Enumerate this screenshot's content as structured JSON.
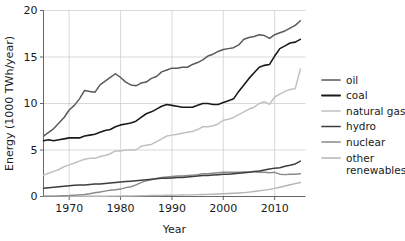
{
  "chart_data": {
    "type": "line",
    "title": "",
    "xlabel": "Year",
    "ylabel": "Energy (1000 TWh/year)",
    "xlim": [
      1965,
      2016
    ],
    "ylim": [
      0,
      20
    ],
    "xticks": [
      1970,
      1980,
      1990,
      2000,
      2010
    ],
    "yticks": [
      0,
      5,
      10,
      15,
      20
    ],
    "xticklabels": [
      "1970",
      "1980",
      "1990",
      "2000",
      "2010"
    ],
    "yticklabels": [
      "0",
      "5",
      "10",
      "15",
      "20"
    ],
    "grid": true,
    "legend_position": "right",
    "x": [
      1965,
      1966,
      1967,
      1968,
      1969,
      1970,
      1971,
      1972,
      1973,
      1974,
      1975,
      1976,
      1977,
      1978,
      1979,
      1980,
      1981,
      1982,
      1983,
      1984,
      1985,
      1986,
      1987,
      1988,
      1989,
      1990,
      1991,
      1992,
      1993,
      1994,
      1995,
      1996,
      1997,
      1998,
      1999,
      2000,
      2001,
      2002,
      2003,
      2004,
      2005,
      2006,
      2007,
      2008,
      2009,
      2010,
      2011,
      2012,
      2013,
      2014,
      2015
    ],
    "series": [
      {
        "name": "oil",
        "color": "#5a5a5a",
        "width": 1.5,
        "values": [
          6.5,
          6.9,
          7.3,
          7.9,
          8.5,
          9.3,
          9.8,
          10.5,
          11.4,
          11.3,
          11.2,
          12.0,
          12.4,
          12.8,
          13.2,
          12.8,
          12.3,
          12.0,
          11.9,
          12.2,
          12.3,
          12.7,
          12.9,
          13.4,
          13.6,
          13.8,
          13.8,
          13.9,
          13.9,
          14.2,
          14.4,
          14.7,
          15.1,
          15.3,
          15.6,
          15.8,
          15.9,
          16.0,
          16.3,
          16.9,
          17.1,
          17.2,
          17.4,
          17.3,
          17.0,
          17.4,
          17.6,
          17.8,
          18.1,
          18.4,
          18.9
        ]
      },
      {
        "name": "coal",
        "color": "#1a1a1a",
        "width": 1.6,
        "values": [
          6.0,
          6.1,
          6.0,
          6.1,
          6.2,
          6.3,
          6.3,
          6.3,
          6.5,
          6.6,
          6.7,
          6.9,
          7.1,
          7.2,
          7.5,
          7.7,
          7.8,
          7.9,
          8.1,
          8.5,
          8.9,
          9.1,
          9.4,
          9.7,
          9.9,
          9.8,
          9.7,
          9.6,
          9.6,
          9.6,
          9.8,
          10.0,
          10.0,
          9.9,
          9.9,
          10.1,
          10.3,
          10.5,
          11.3,
          12.0,
          12.7,
          13.3,
          13.9,
          14.1,
          14.2,
          15.1,
          15.9,
          16.2,
          16.5,
          16.6,
          16.9
        ]
      },
      {
        "name": "natural gas",
        "color": "#c0c0c0",
        "width": 1.5,
        "values": [
          2.3,
          2.5,
          2.7,
          2.9,
          3.2,
          3.4,
          3.6,
          3.8,
          4.0,
          4.1,
          4.1,
          4.3,
          4.4,
          4.6,
          4.9,
          4.9,
          5.0,
          5.0,
          5.0,
          5.4,
          5.5,
          5.6,
          5.9,
          6.2,
          6.5,
          6.6,
          6.7,
          6.8,
          6.9,
          7.0,
          7.2,
          7.5,
          7.5,
          7.6,
          7.8,
          8.2,
          8.3,
          8.5,
          8.8,
          9.1,
          9.4,
          9.6,
          10.0,
          10.2,
          9.9,
          10.7,
          11.0,
          11.3,
          11.5,
          11.6,
          13.7
        ]
      },
      {
        "name": "hydro",
        "color": "#3d3d3d",
        "width": 1.5,
        "values": [
          0.9,
          0.95,
          1.0,
          1.05,
          1.1,
          1.15,
          1.2,
          1.25,
          1.25,
          1.3,
          1.35,
          1.35,
          1.4,
          1.45,
          1.5,
          1.55,
          1.6,
          1.65,
          1.7,
          1.75,
          1.8,
          1.85,
          1.9,
          1.95,
          1.95,
          2.0,
          2.05,
          2.05,
          2.1,
          2.15,
          2.2,
          2.25,
          2.25,
          2.3,
          2.35,
          2.4,
          2.4,
          2.45,
          2.5,
          2.55,
          2.6,
          2.7,
          2.75,
          2.85,
          2.95,
          3.05,
          3.1,
          3.25,
          3.35,
          3.5,
          3.8
        ]
      },
      {
        "name": "nuclear",
        "color": "#8a8a8a",
        "width": 1.4,
        "values": [
          0.02,
          0.03,
          0.04,
          0.06,
          0.08,
          0.1,
          0.14,
          0.18,
          0.22,
          0.3,
          0.4,
          0.48,
          0.58,
          0.68,
          0.72,
          0.8,
          0.95,
          1.05,
          1.25,
          1.5,
          1.7,
          1.8,
          1.95,
          2.05,
          2.1,
          2.15,
          2.2,
          2.2,
          2.25,
          2.3,
          2.35,
          2.45,
          2.45,
          2.5,
          2.55,
          2.6,
          2.6,
          2.6,
          2.6,
          2.65,
          2.65,
          2.65,
          2.6,
          2.6,
          2.55,
          2.6,
          2.4,
          2.35,
          2.4,
          2.4,
          2.45
        ]
      },
      {
        "name": "other renewables",
        "color": "#b5b5b5",
        "width": 1.4,
        "values": [
          0.01,
          0.01,
          0.01,
          0.01,
          0.01,
          0.01,
          0.02,
          0.02,
          0.02,
          0.02,
          0.03,
          0.03,
          0.03,
          0.04,
          0.04,
          0.05,
          0.05,
          0.06,
          0.07,
          0.08,
          0.09,
          0.1,
          0.11,
          0.12,
          0.13,
          0.14,
          0.15,
          0.16,
          0.17,
          0.18,
          0.2,
          0.21,
          0.23,
          0.25,
          0.27,
          0.3,
          0.32,
          0.35,
          0.38,
          0.42,
          0.47,
          0.53,
          0.6,
          0.68,
          0.76,
          0.88,
          1.0,
          1.13,
          1.26,
          1.38,
          1.5
        ]
      }
    ],
    "legend": [
      {
        "label": "oil",
        "color": "#5a5a5a"
      },
      {
        "label": "coal",
        "color": "#1a1a1a"
      },
      {
        "label": "natural gas",
        "color": "#c0c0c0"
      },
      {
        "label": "hydro",
        "color": "#3d3d3d"
      },
      {
        "label": "nuclear",
        "color": "#8a8a8a"
      },
      {
        "label": "other",
        "color": "#b5b5b5"
      }
    ],
    "legend_extra_line": "renewables"
  },
  "colors": {
    "background": "#ffffff",
    "grid": "#c9c9c9",
    "axis": "#555555",
    "text": "#1a1a1a"
  }
}
